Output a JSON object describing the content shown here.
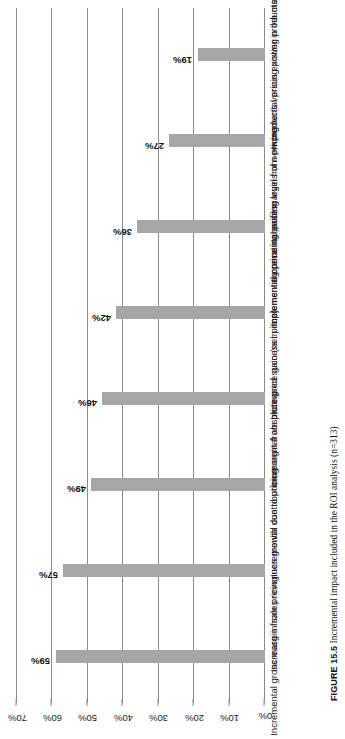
{
  "figure": {
    "caption_label": "FIGURE 15.5",
    "caption_text": "Incremental impact included in the ROI analysis (n=313)"
  },
  "chart_data": {
    "type": "bar",
    "title": "",
    "xlabel": "",
    "ylabel": "",
    "ylim": [
      0,
      70
    ],
    "grid": true,
    "legend": "none",
    "orientation": "vertical-printed-sideways",
    "categories": [
      "Incremental gross margin from pricing",
      "Increase in sales revenues growth due to pricing",
      "Incremental contribution margin from pricing",
      "Incremental absolute price gain (net price)",
      "Increased success in implementing price increases",
      "Incremental operating profit margin from pricing",
      "Incremental pricing levels of new products versus existing products",
      "Incremental pricing power in the marketplace"
    ],
    "values": [
      59,
      57,
      49,
      46,
      42,
      36,
      27,
      19
    ],
    "value_labels": [
      "59%",
      "57%",
      "49%",
      "46%",
      "42%",
      "36%",
      "27%",
      "19%"
    ],
    "tick_labels": [
      "0%",
      "10%",
      "20%",
      "30%",
      "40%",
      "50%",
      "60%",
      "70%"
    ],
    "tick_values": [
      0,
      10,
      20,
      30,
      40,
      50,
      60,
      70
    ],
    "bar_color": "#a6a6a6",
    "gridline_color": "#8a8a8a"
  }
}
